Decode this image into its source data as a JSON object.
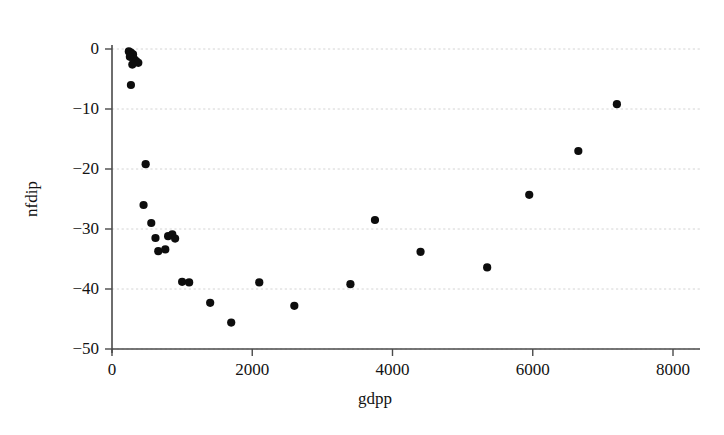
{
  "chart_data": {
    "type": "scatter",
    "title": "",
    "xlabel": "gdpp",
    "ylabel": "nfdip",
    "xlim": [
      0,
      8000
    ],
    "ylim": [
      -50,
      0
    ],
    "xticks": [
      0,
      2000,
      4000,
      6000,
      8000
    ],
    "yticks": [
      0,
      -10,
      -20,
      -30,
      -40,
      -50
    ],
    "xtick_labels": [
      "0",
      "2000",
      "4000",
      "6000",
      "8000"
    ],
    "ytick_labels": [
      "0",
      "-10",
      "-20",
      "-30",
      "-40",
      "-50"
    ],
    "grid": true,
    "grid_axis": "y",
    "legend": null,
    "marker": "filled-circle",
    "marker_color": "#0d0d0d",
    "points": [
      {
        "x": 240,
        "y": -0.4
      },
      {
        "x": 270,
        "y": -0.6
      },
      {
        "x": 300,
        "y": -0.9
      },
      {
        "x": 255,
        "y": -1.3
      },
      {
        "x": 315,
        "y": -1.7
      },
      {
        "x": 345,
        "y": -2.0
      },
      {
        "x": 375,
        "y": -2.3
      },
      {
        "x": 290,
        "y": -2.6
      },
      {
        "x": 270,
        "y": -6.0
      },
      {
        "x": 480,
        "y": -19.2
      },
      {
        "x": 450,
        "y": -26.0
      },
      {
        "x": 560,
        "y": -29.0
      },
      {
        "x": 620,
        "y": -31.5
      },
      {
        "x": 800,
        "y": -31.2
      },
      {
        "x": 860,
        "y": -30.9
      },
      {
        "x": 900,
        "y": -31.6
      },
      {
        "x": 660,
        "y": -33.7
      },
      {
        "x": 760,
        "y": -33.4
      },
      {
        "x": 1000,
        "y": -38.8
      },
      {
        "x": 1100,
        "y": -38.9
      },
      {
        "x": 1400,
        "y": -42.3
      },
      {
        "x": 1700,
        "y": -45.6
      },
      {
        "x": 2100,
        "y": -38.9
      },
      {
        "x": 2600,
        "y": -42.8
      },
      {
        "x": 3400,
        "y": -39.2
      },
      {
        "x": 3750,
        "y": -28.5
      },
      {
        "x": 4400,
        "y": -33.8
      },
      {
        "x": 5350,
        "y": -36.4
      },
      {
        "x": 5950,
        "y": -24.3
      },
      {
        "x": 6650,
        "y": -17.0
      },
      {
        "x": 7200,
        "y": -9.2
      }
    ]
  }
}
